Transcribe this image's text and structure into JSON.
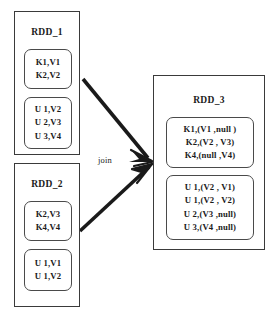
{
  "diagram": {
    "background_color": "#ffffff",
    "line_color": "#3a3a3a",
    "arrow_color": "#1a1a1a"
  },
  "nodes": [
    {
      "id": "rdd1",
      "label": "RDD_1",
      "partitions": [
        {
          "id": "rdd1-p1",
          "rows": [
            "K1,V1",
            "K2,V2"
          ]
        },
        {
          "id": "rdd1-p2",
          "rows": [
            "U 1,V2",
            "U 2,V3",
            "U 3,V4"
          ]
        }
      ]
    },
    {
      "id": "rdd2",
      "label": "RDD_2",
      "partitions": [
        {
          "id": "rdd2-p1",
          "rows": [
            "K2,V3",
            "K4,V4"
          ]
        },
        {
          "id": "rdd2-p2",
          "rows": [
            "U 1,V1",
            "U 1,V2"
          ]
        }
      ]
    },
    {
      "id": "rdd3",
      "label": "RDD_3",
      "partitions": [
        {
          "id": "rdd3-p1",
          "rows": [
            "K1,(V1 ,null )",
            "K2,(V2 , V3)",
            "K4,(null ,V4)"
          ]
        },
        {
          "id": "rdd3-p2",
          "rows": [
            "U 1,(V2 , V1)",
            "U 1,(V2 , V2)",
            "U 2,(V3 ,null)",
            "U 3,(V4 ,null)"
          ]
        }
      ]
    }
  ],
  "edges": [
    {
      "id": "edge-rdd1-rdd3",
      "label": "",
      "from": "rdd1",
      "to": "rdd3"
    },
    {
      "id": "edge-rdd2-rdd3",
      "label": "join",
      "from": "rdd2",
      "to": "rdd3"
    }
  ],
  "labels": {
    "join": "join"
  }
}
